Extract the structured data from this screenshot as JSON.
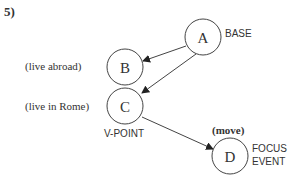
{
  "example_number": "5)",
  "nodes": {
    "A": {
      "label": "A",
      "role": "BASE"
    },
    "B": {
      "label": "B",
      "annotation": "(live abroad)"
    },
    "C": {
      "label": "C",
      "annotation": "(live in Rome)",
      "role": "V-POINT"
    },
    "D": {
      "label": "D",
      "annotation": "(move)",
      "role_line1": "FOCUS",
      "role_line2": "EVENT"
    }
  },
  "edges": [
    {
      "from": "A",
      "to": "B"
    },
    {
      "from": "A",
      "to": "C"
    },
    {
      "from": "C",
      "to": "D"
    }
  ],
  "colors": {
    "stroke": "#444444",
    "text": "#333333"
  }
}
